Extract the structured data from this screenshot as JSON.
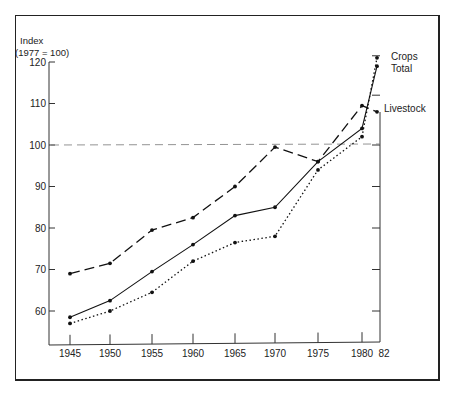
{
  "chart_data": {
    "type": "line",
    "title": "",
    "ylabel": "Index (1977 = 100)",
    "ylabel_lines": [
      "Index",
      "(1977 = 100)"
    ],
    "xlabel": "",
    "x": [
      1945,
      1950,
      1955,
      1960,
      1965,
      1970,
      1975,
      1980,
      1982
    ],
    "x_tick_labels": [
      "1945",
      "1950",
      "1955",
      "1960",
      "1965",
      "1970",
      "1975",
      "1980",
      "82"
    ],
    "y_ticks": [
      60,
      70,
      80,
      90,
      100,
      110,
      120
    ],
    "y_tick_labels": [
      "60",
      "70",
      "80",
      "90",
      "100",
      "110",
      "120"
    ],
    "ylim": [
      52,
      120
    ],
    "xlim": [
      1942,
      1982
    ],
    "grid": false,
    "reference_line": {
      "y": 100,
      "style": "dashed"
    },
    "series": [
      {
        "name": "Crops",
        "style": "dotted",
        "values": [
          57,
          60,
          64.5,
          72,
          76.5,
          78,
          94,
          102,
          121
        ]
      },
      {
        "name": "Total",
        "style": "solid",
        "values": [
          58.5,
          62.5,
          69.5,
          76,
          83,
          85,
          96,
          104,
          119
        ]
      },
      {
        "name": "Livestock",
        "style": "dashed",
        "values": [
          69,
          71.5,
          79.5,
          82.5,
          90,
          99.5,
          96,
          109.5,
          108
        ]
      }
    ],
    "legend": "direct labels at right end of lines"
  },
  "labels": {
    "y_title_1": "Index",
    "y_title_2": "(1977 = 100)",
    "crops": "Crops",
    "total": "Total",
    "livestock": "Livestock"
  }
}
